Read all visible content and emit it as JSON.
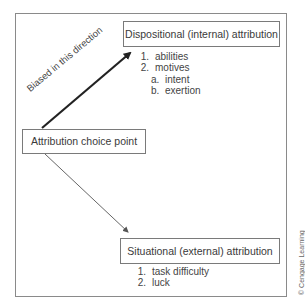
{
  "diagram": {
    "nodes": {
      "dispositional": {
        "label": "Dispositional (internal) attribution",
        "items": [
          {
            "num": "1.",
            "text": "abilities"
          },
          {
            "num": "2.",
            "text": "motives"
          }
        ],
        "subitems": [
          {
            "num": "a.",
            "text": "intent"
          },
          {
            "num": "b.",
            "text": "exertion"
          }
        ]
      },
      "choice_point": {
        "label": "Attribution choice point"
      },
      "situational": {
        "label": "Situational (external) attribution",
        "items": [
          {
            "num": "1.",
            "text": "task difficulty"
          },
          {
            "num": "2.",
            "text": "luck"
          }
        ]
      }
    },
    "edges": [
      {
        "from": "choice_point",
        "to": "dispositional",
        "label": "Biased in this direction",
        "style": "thick"
      },
      {
        "from": "choice_point",
        "to": "situational",
        "label": "",
        "style": "thin"
      }
    ],
    "copyright": "© Cengage Learning"
  },
  "colors": {
    "frame": "#8a8a8a",
    "box_border": "#7a7a7a",
    "text": "#3a3a3a",
    "thick_arrow": "#222222",
    "thin_arrow": "#555555"
  }
}
